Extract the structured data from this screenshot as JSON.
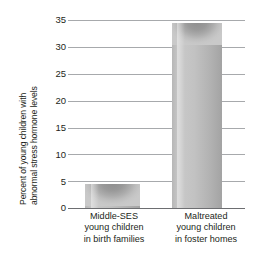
{
  "chart_data": {
    "type": "bar",
    "title": "",
    "subtitle": "",
    "xlabel": "",
    "ylabel": "Percent of young children with abnormal stress hormone levels",
    "ylabel_lines": [
      "Percent of young children with",
      "abnormal stress hormone levels"
    ],
    "categories": [
      "Middle-SES young children in birth families",
      "Maltreated young children in foster homes"
    ],
    "category_lines": [
      [
        "Middle-SES",
        "young children",
        "in birth families"
      ],
      [
        "Maltreated",
        "young children",
        "in foster homes"
      ]
    ],
    "values": [
      4.5,
      34.5
    ],
    "ylim": [
      0,
      35
    ],
    "yticks": [
      0,
      5,
      10,
      15,
      20,
      25,
      30,
      35
    ],
    "ytick_labels": [
      "0",
      "5",
      "10",
      "15",
      "20",
      "25",
      "30",
      "35"
    ],
    "grid": true,
    "grid_orientation": "horizontal",
    "legend": false,
    "legend_position": "none",
    "bar_style": "cylinder-3d",
    "colors": {
      "bar_fill": "#c2c2c2",
      "bar_shadow": "#8e8e8e",
      "gridline": "#a7a9ac",
      "baseline": "#6d6e71",
      "text": "#231f20",
      "background": "#ffffff"
    }
  }
}
